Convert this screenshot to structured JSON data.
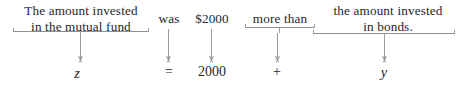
{
  "diagram": {
    "kind": "word-problem-translation",
    "sentence": "The amount invested in the mutual fund was $2000 more than the amount invested in bonds.",
    "equation": "z = 2000 + y",
    "colors": {
      "text": "#26262a",
      "rule": "#97979c",
      "background": "#ffffff"
    },
    "columns": [
      {
        "id": "mutual-fund",
        "phrase": "The amount invested\nin the mutual fund",
        "braced": true,
        "symbol": "z",
        "symbol_style": "italic"
      },
      {
        "id": "was",
        "phrase": "was",
        "braced": false,
        "symbol": "=",
        "symbol_style": "roman"
      },
      {
        "id": "amount",
        "phrase": "$2000",
        "braced": false,
        "symbol": "2000",
        "symbol_style": "roman"
      },
      {
        "id": "more-than",
        "phrase": "more than",
        "braced": true,
        "symbol": "+",
        "symbol_style": "roman"
      },
      {
        "id": "bonds",
        "phrase": "the amount invested\nin bonds.",
        "braced": true,
        "symbol": "y",
        "symbol_style": "italic"
      }
    ]
  }
}
